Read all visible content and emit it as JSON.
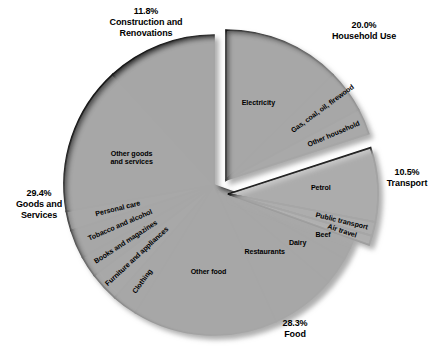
{
  "chart_data": {
    "type": "pie",
    "title": "",
    "subtitle": "",
    "xlabel": "",
    "ylabel": "",
    "grid": false,
    "legend_position": "none",
    "units": "percent of household expenditure",
    "groups": [
      {
        "name": "Construction and Renovations",
        "percent": "11.8%",
        "value": 11.8
      },
      {
        "name": "Household Use",
        "percent": "20.0%",
        "value": 20.0
      },
      {
        "name": "Transport",
        "percent": "10.5%",
        "value": 10.5
      },
      {
        "name": "Food",
        "percent": "28.3%",
        "value": 28.3
      },
      {
        "name": "Goods and Services",
        "percent": "29.4%",
        "value": 29.4
      }
    ],
    "slices": [
      {
        "label": "Construction and renovations",
        "value": 11.8,
        "color": "#2b2b2b",
        "group": "Construction and Renovations"
      },
      {
        "label": "Electricity",
        "value": 12.6,
        "color": "#4f4f4f",
        "group": "Household Use"
      },
      {
        "label": "Gas, coal, oil, firewood",
        "value": 4.6,
        "color": "#6b6b6b",
        "group": "Household Use"
      },
      {
        "label": "Other household",
        "value": 2.8,
        "color": "#8f8f8f",
        "group": "Household Use"
      },
      {
        "label": "Petrol",
        "value": 8.0,
        "color": "#c9c9c9",
        "group": "Transport"
      },
      {
        "label": "Public transport",
        "value": 1.5,
        "color": "#e8e8e8",
        "group": "Transport"
      },
      {
        "label": "Air travel",
        "value": 1.0,
        "color": "#f2f2f2",
        "group": "Transport"
      },
      {
        "label": "Beef",
        "value": 2.7,
        "color": "#4a4a4a",
        "group": "Food"
      },
      {
        "label": "Dairy",
        "value": 3.0,
        "color": "#5c5c5c",
        "group": "Food"
      },
      {
        "label": "Restaurants",
        "value": 7.0,
        "color": "#6f6f6f",
        "group": "Food"
      },
      {
        "label": "Other food",
        "value": 15.6,
        "color": "#565656",
        "group": "Food"
      },
      {
        "label": "Clothing",
        "value": 2.7,
        "color": "#6a6a6a",
        "group": "Goods and Services"
      },
      {
        "label": "Furniture and appliances",
        "value": 3.2,
        "color": "#8a8a8a",
        "group": "Goods and Services"
      },
      {
        "label": "Books and magazines",
        "value": 2.3,
        "color": "#5e5e5e",
        "group": "Goods and Services"
      },
      {
        "label": "Tobacco and alcohol",
        "value": 3.1,
        "color": "#3d3d3d",
        "group": "Goods and Services"
      },
      {
        "label": "Personal care",
        "value": 2.1,
        "color": "#7d7d7d",
        "group": "Goods and Services"
      },
      {
        "label": "Other goods and services",
        "value": 16.0,
        "color": "#4b4b4b",
        "group": "Goods and Services"
      }
    ]
  },
  "labels": {
    "construction": "11.8%\nConstruction and\nRenovations",
    "household_use": "20.0%\nHousehold Use",
    "transport": "10.5%\nTransport",
    "food": "28.3%\nFood",
    "goods_services": "29.4%\nGoods and\nServices"
  },
  "slice_text": {
    "electricity": "Electricity",
    "gas_coal_oil_firewood": "Gas, coal, oil, firewood",
    "other_household": "Other household",
    "petrol": "Petrol",
    "public_transport": "Public transport",
    "air_travel": "Air travel",
    "beef": "Beef",
    "dairy": "Dairy",
    "restaurants": "Restaurants",
    "other_food": "Other food",
    "clothing": "Clothing",
    "furniture_and_appliances": "Furniture and appliances",
    "books_and_magazines": "Books and magazines",
    "tobacco_and_alcohol": "Tobacco and alcohol",
    "personal_care": "Personal care",
    "other_goods_and_services": "Other goods\nand services"
  },
  "colors": {
    "background": "#ffffff",
    "outline": "#000000",
    "text": "#000000",
    "shadow": "#b8b8b8"
  }
}
